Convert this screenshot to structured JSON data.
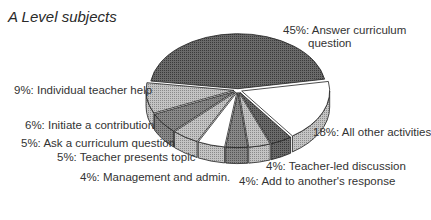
{
  "chart_data": {
    "type": "pie",
    "title": "A Level subjects",
    "style": "3d-exploded",
    "slices": [
      {
        "label": "Answer curriculum question",
        "value": 45,
        "display": "45%: Answer curriculum",
        "display2": "question",
        "fill": "#6e6e6e"
      },
      {
        "label": "All other activities",
        "value": 18,
        "display": "18%: All other activities",
        "fill": "#ffffff"
      },
      {
        "label": "Teacher-led discussion",
        "value": 4,
        "display": "4%: Teacher-led discussion",
        "fill": "#5a5a5a"
      },
      {
        "label": "Add to another's response",
        "value": 4,
        "display": "4%: Add to another's response",
        "fill": "#a8a8a8"
      },
      {
        "label": "Management and admin.",
        "value": 4,
        "display": "4%: Management and admin.",
        "fill": "#6a6a6a"
      },
      {
        "label": "Teacher presents topic",
        "value": 5,
        "display": "5%: Teacher presents topic",
        "fill": "#ffffff"
      },
      {
        "label": "Ask a curriculum question",
        "value": 5,
        "display": "5%: Ask a curriculum question",
        "fill": "#b0b0b0"
      },
      {
        "label": "Initiate a contribution",
        "value": 6,
        "display": "6%: Initiate a contribution",
        "fill": "#7a7a7a"
      },
      {
        "label": "Individual teacher help",
        "value": 9,
        "display": "9%: Individual teacher help",
        "fill": "#ffffff"
      }
    ],
    "legend": "none (direct labels)"
  }
}
